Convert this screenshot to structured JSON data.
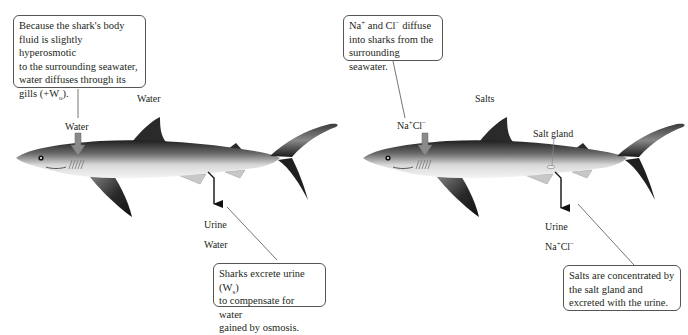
{
  "panels": [
    {
      "id": "water",
      "callout_top": {
        "lines": [
          "Because the shark's body",
          "fluid is slightly hyperosmotic",
          "to the surrounding seawater,",
          "water diffuses through its",
          "gills (+W"
        ],
        "subscript": "o",
        "tail": ")."
      },
      "heading": "Water",
      "gill_label": "Water",
      "excretion_label": "Urine",
      "excretion_sublabel": "Water",
      "callout_bottom": {
        "line1_pre": "Sharks excrete urine (W",
        "line1_sub": "s",
        "line1_post": ")",
        "line2": "to compensate for water",
        "line3": "gained by osmosis."
      }
    },
    {
      "id": "salts",
      "callout_top": {
        "line1_na": "Na",
        "line1_plus": "+",
        "line1_mid": " and Cl",
        "line1_minus": "−",
        "line1_post": " diffuse",
        "line2": "into sharks from the",
        "line3": "surrounding seawater."
      },
      "heading": "Salts",
      "gill_label_na": "Na",
      "gill_label_plus": "+",
      "gill_label_cl": "Cl",
      "gill_label_minus": "−",
      "organ_label": "Salt gland",
      "excretion_label": "Urine",
      "excretion_sublabel_na": "Na",
      "excretion_sublabel_plus": "+",
      "excretion_sublabel_cl": "Cl",
      "excretion_sublabel_minus": "−",
      "callout_bottom": {
        "line1": "Salts are concentrated by",
        "line2": "the salt gland and",
        "line3": "excreted with the urine."
      }
    }
  ],
  "colors": {
    "shark_dark": "#2a2a2a",
    "shark_light": "#e8e8e8",
    "influx_arrow": "#8a8a8a",
    "excretion_arrow": "#111111",
    "leader_line": "#666666"
  }
}
